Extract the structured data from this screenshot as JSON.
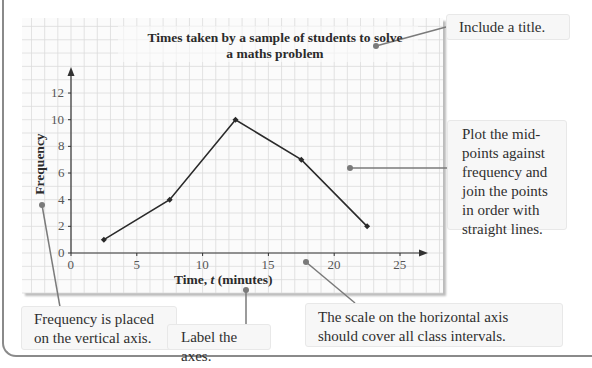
{
  "chart_data": {
    "type": "line",
    "title": "Times taken by a sample of students to solve a maths problem",
    "title_lines": [
      "Times taken by a sample of students to solve",
      "a maths problem"
    ],
    "xlabel": "Time, t (minutes)",
    "ylabel": "Frequency",
    "x": [
      2.5,
      7.5,
      12.5,
      17.5,
      22.5
    ],
    "values": [
      1,
      4,
      10,
      7,
      2
    ],
    "xlim": [
      0,
      27
    ],
    "ylim": [
      0,
      14
    ],
    "x_ticks": [
      "0",
      "5",
      "10",
      "15",
      "20",
      "25"
    ],
    "y_ticks": [
      "0",
      "2",
      "4",
      "6",
      "8",
      "10",
      "12"
    ],
    "grid": true,
    "markers": "diamond"
  },
  "annotations": {
    "title_note": "Include a title.",
    "plot_note": "Plot the mid-points against frequency and join the points in order with straight lines.",
    "plot_note_lines": [
      "Plot the mid-",
      "points against",
      "frequency and",
      "join the points",
      "in order with",
      "straight lines."
    ],
    "frequency_note_lines": [
      "Frequency is placed",
      "on the vertical axis."
    ],
    "label_note": "Label the axes.",
    "scale_note_lines": [
      "The scale on the horizontal axis",
      "should cover all class intervals."
    ]
  },
  "colors": {
    "line": "#2a2a2a",
    "grid": "#dcdcdc",
    "pointer": "#7a7a7a",
    "note_bg": "#f7f7f7"
  }
}
